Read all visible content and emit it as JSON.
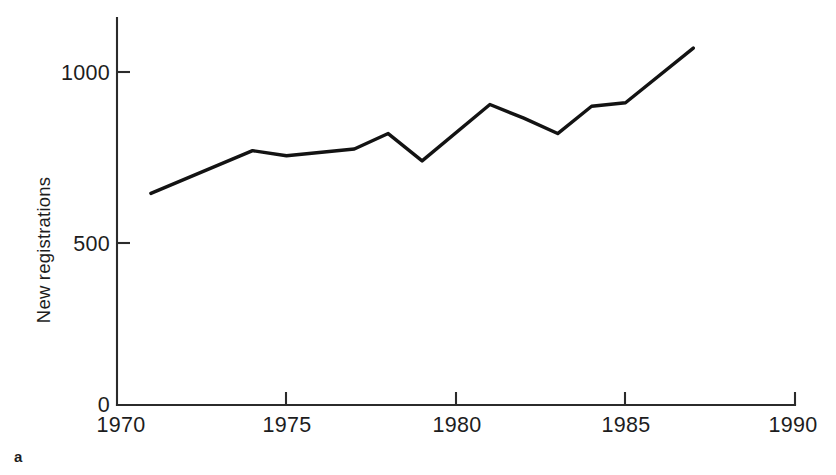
{
  "panel": {
    "label": "a"
  },
  "chart_data": {
    "type": "line",
    "title": "",
    "subtitle": "",
    "xlabel": "",
    "ylabel": "New registrations",
    "xlim": [
      1970,
      1990
    ],
    "ylim": [
      0,
      1150
    ],
    "grid": false,
    "legend": null,
    "x_ticks": [
      1970,
      1975,
      1980,
      1985,
      1990
    ],
    "x_tick_labels": [
      "1970",
      "1975",
      "1980",
      "1985",
      "1990"
    ],
    "y_ticks": [
      0,
      500,
      1000
    ],
    "y_tick_labels": [
      "0",
      "500",
      "1000"
    ],
    "series": [
      {
        "name": "New registrations",
        "color": "#131313",
        "x": [
          1971,
          1974,
          1975,
          1977,
          1978,
          1979,
          1981,
          1982,
          1983,
          1984,
          1985,
          1987
        ],
        "values": [
          645,
          770,
          755,
          775,
          820,
          740,
          905,
          865,
          820,
          900,
          910,
          1070
        ]
      }
    ]
  }
}
